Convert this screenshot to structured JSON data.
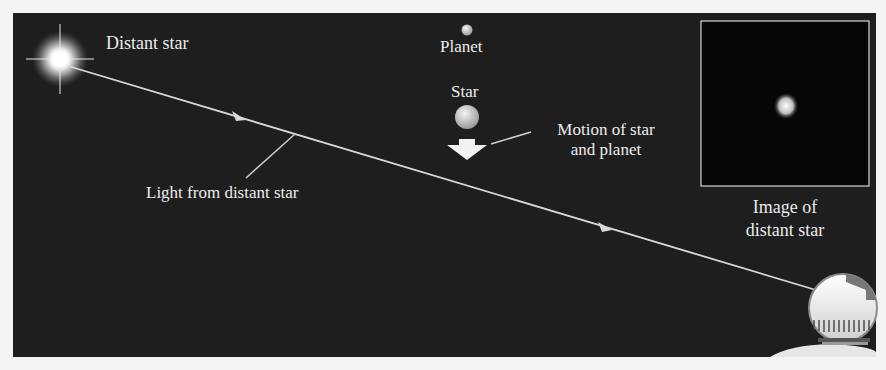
{
  "labels": {
    "distant_star": "Distant star",
    "planet": "Planet",
    "star": "Star",
    "motion_line1": "Motion of star",
    "motion_line2": "and planet",
    "light": "Light from distant star",
    "image_line1": "Image of",
    "image_line2": "distant star"
  },
  "colors": {
    "background": "#1e1e1e",
    "page": "#f4f4f2",
    "line": "#d8d8d8",
    "text": "#ececec"
  }
}
